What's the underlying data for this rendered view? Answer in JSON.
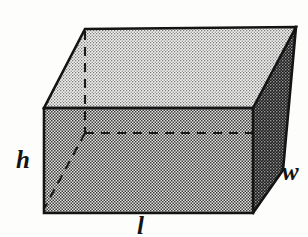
{
  "figure": {
    "name": "rectangular-prism-diagram",
    "background_color": "#fdfdfb",
    "outline_color": "#141414"
  },
  "labels": {
    "height": "h",
    "width": "w",
    "length": "l"
  },
  "faces": {
    "top": {
      "name": "top-face",
      "shade_label": "light",
      "fill_color": "#d3d3d3",
      "points": "85,29 296,27 253,108 44,108"
    },
    "front": {
      "name": "front-face",
      "shade_label": "medium",
      "fill_color": "#9a9a9a",
      "points": "44,108 253,108 253,213 44,213"
    },
    "right": {
      "name": "right-face",
      "shade_label": "dark",
      "fill_color": "#555555",
      "points": "296,27 253,108 253,213 283,170"
    }
  },
  "hidden_edges": {
    "vertical": {
      "name": "hidden-vertical-edge",
      "x1": 85,
      "y1": 29,
      "x2": 85,
      "y2": 133
    },
    "horizontal": {
      "name": "hidden-horizontal-edge",
      "x1": 85,
      "y1": 133,
      "x2": 253,
      "y2": 133
    },
    "diagonal": {
      "name": "hidden-diagonal-edge",
      "x1": 85,
      "y1": 133,
      "x2": 45,
      "y2": 207
    }
  },
  "chart_data": {
    "type": "diagram",
    "title": "",
    "annotations": [
      "h",
      "w",
      "l"
    ]
  }
}
